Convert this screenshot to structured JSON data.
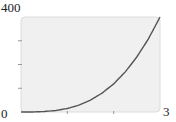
{
  "chart_data": {
    "type": "line",
    "title": "",
    "xlabel": "",
    "ylabel": "",
    "xlim": [
      0,
      3
    ],
    "ylim": [
      0,
      400
    ],
    "x_tick_labels": [
      "0",
      "3"
    ],
    "y_tick_labels": [
      "0",
      "400"
    ],
    "x_ticks": [
      1,
      2
    ],
    "y_ticks": [
      100,
      200,
      300
    ],
    "grid": false,
    "legend": null,
    "series": [
      {
        "name": "curve",
        "x": [
          0,
          0.25,
          0.5,
          0.75,
          1,
          1.25,
          1.5,
          1.75,
          2,
          2.25,
          2.5,
          2.75,
          3
        ],
        "values": [
          0,
          0.2,
          1.9,
          6.2,
          14.8,
          28.9,
          50,
          79.4,
          118.5,
          168.8,
          231.5,
          308.1,
          400
        ]
      }
    ],
    "colors": {
      "plot_background": "#f0f0f0",
      "plot_border": "#dcdcdc",
      "line": "#555555"
    }
  },
  "labels": {
    "y_max": "400",
    "origin": "0",
    "x_max": "3"
  }
}
